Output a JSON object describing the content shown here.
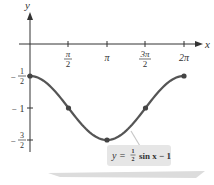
{
  "chart_data": {
    "type": "line",
    "title": "",
    "xlabel": "x",
    "ylabel": "y",
    "x_ticks": [
      "π/2",
      "π",
      "3π/2",
      "2π"
    ],
    "y_ticks": [
      "-1/2",
      "-1",
      "-3/2"
    ],
    "xlim": [
      0,
      6.2832
    ],
    "ylim": [
      -1.5,
      0
    ],
    "grid": false,
    "series": [
      {
        "name": "y = ½ sin x − 1",
        "x": [
          0,
          1.5708,
          3.1416,
          4.7124,
          6.2832
        ],
        "x_labels": [
          "0",
          "π/2",
          "π",
          "3π/2",
          "2π"
        ],
        "values": [
          -0.5,
          -1,
          -1.5,
          -1,
          -0.5
        ],
        "color": "#555555",
        "marked_points": true
      }
    ],
    "annotations": [
      {
        "text": "y = ½ sin x − 1",
        "position": "below curve minimum, right",
        "style": "grey rounded box with leader line"
      }
    ]
  },
  "axes": {
    "x_label": "x",
    "y_label": "y",
    "x_tick_labels": [
      {
        "num": "π",
        "den": "2"
      },
      {
        "num": "π",
        "den": ""
      },
      {
        "num": "3π",
        "den": "2"
      },
      {
        "num": "2π",
        "den": ""
      }
    ],
    "y_tick_labels": [
      {
        "sign": "−",
        "num": "1",
        "den": "2"
      },
      {
        "sign": "−",
        "num": "1",
        "den": ""
      },
      {
        "sign": "−",
        "num": "3",
        "den": "2"
      }
    ]
  },
  "callout": {
    "prefix": "y =",
    "frac_num": "1",
    "frac_den": "2",
    "suffix": "sin x − 1"
  },
  "colors": {
    "curve": "#555555",
    "axis": "#333333",
    "callout_bg": "#e6e6e6",
    "shadow": "#d4d4d4"
  }
}
